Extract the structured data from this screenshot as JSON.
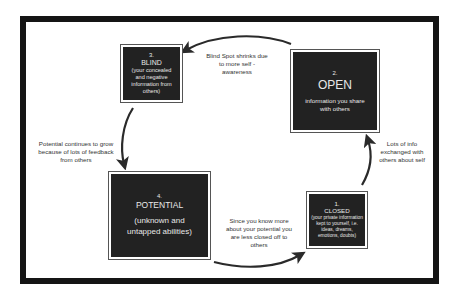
{
  "diagram": {
    "type": "cycle",
    "colors": {
      "frame": "#151515",
      "box_fill": "#222222",
      "box_text": "#e8e8e8",
      "label_text": "#333333",
      "arrow": "#2a2a2a",
      "background": "#ffffff"
    },
    "boxes": {
      "blind": {
        "number": "3.",
        "title": "BLIND",
        "description": "(your concealed and negative information from others)"
      },
      "open": {
        "number": "2.",
        "title": "OPEN",
        "description": "information you share with others"
      },
      "potential": {
        "number": "4.",
        "title": "POTENTIAL",
        "description": "(unknown and untapped abilities)"
      },
      "closed": {
        "number": "1.",
        "title": "CLOSED",
        "description": "(your private information kept to yourself, i.e. ideas, dreams, emotions, doubts)"
      }
    },
    "arrow_labels": {
      "open_to_blind": "Blind Spot shrinks due to more self - awareness",
      "blind_to_potential": "Potential continues to grow because of lots of feedback from others",
      "potential_to_closed": "Since you know more about your potential you are less closed off to others",
      "closed_to_open": "Lots of info exchanged with others about self"
    }
  }
}
